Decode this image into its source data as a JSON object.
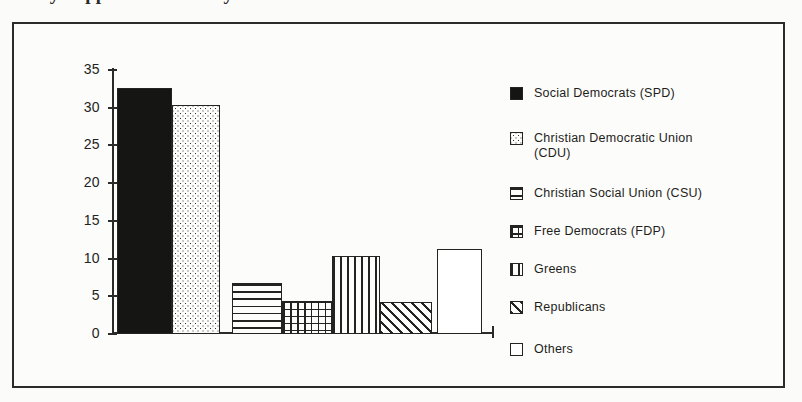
{
  "page": {
    "title_remnant": "Party Support in Germany"
  },
  "chart_data": {
    "type": "bar",
    "title": "",
    "xlabel": "",
    "ylabel": "",
    "ylim": [
      0,
      35
    ],
    "grid": false,
    "legend_position": "right",
    "y_ticks": [
      "35",
      "30",
      "25",
      "20",
      "15",
      "10",
      "5",
      "0"
    ],
    "y_tick_values": [
      35,
      30,
      25,
      20,
      15,
      10,
      5,
      0
    ],
    "categories": [
      "Social Democrats (SPD)",
      "Christian Democratic Union (CDU)",
      "Christian Social Union (CSU)",
      "Free Democrats (FDP)",
      "Greens",
      "Republicans",
      "Others"
    ],
    "values": [
      32.6,
      30.3,
      6.8,
      4.4,
      10.4,
      4.3,
      11.3
    ],
    "bars": [
      {
        "label": "Social Democrats (SPD)",
        "value": 32.6,
        "pattern": "solid",
        "fill_color": "#151513"
      },
      {
        "label": "Christian Democratic Union (CDU)",
        "value": 30.3,
        "pattern": "dotted",
        "fill_color": "#fdfdfb"
      },
      {
        "label": "Christian Social Union (CSU)",
        "value": 6.8,
        "pattern": "hlines",
        "fill_color": "#fdfdfb"
      },
      {
        "label": "Free Democrats (FDP)",
        "value": 4.4,
        "pattern": "grid",
        "fill_color": "#fdfdfb"
      },
      {
        "label": "Greens",
        "value": 10.4,
        "pattern": "vlines",
        "fill_color": "#fdfdfb"
      },
      {
        "label": "Republicans",
        "value": 4.3,
        "pattern": "diag",
        "fill_color": "#fdfdfb"
      },
      {
        "label": "Others",
        "value": 11.3,
        "pattern": "white",
        "fill_color": "#ffffff"
      }
    ]
  },
  "legend": {
    "items": [
      {
        "label": "Social Democrats (SPD)",
        "pattern": "solid"
      },
      {
        "label": "Christian Democratic Union\n(CDU)",
        "pattern": "dotted"
      },
      {
        "label": "Christian Social Union (CSU)",
        "pattern": "hlines"
      },
      {
        "label": "Free Democrats (FDP)",
        "pattern": "grid"
      },
      {
        "label": "Greens",
        "pattern": "vlines"
      },
      {
        "label": "Republicans",
        "pattern": "diag"
      },
      {
        "label": "Others",
        "pattern": "white"
      }
    ]
  },
  "colors": {
    "ink": "#232321",
    "frame": "#2b2b29",
    "paper": "#fcfcfa"
  }
}
